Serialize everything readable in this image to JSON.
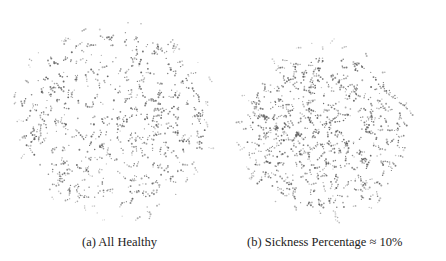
{
  "figure": {
    "subfigures": [
      {
        "label": "(a)",
        "caption": "(a) All Healthy",
        "cloud": {
          "cx": 115,
          "cy": 120,
          "radius": 103,
          "count": 560,
          "seed": 7,
          "core": 0.55
        },
        "caption_x": 82
      },
      {
        "label": "(b)",
        "caption": "(b) Sickness Percentage ≈ 10%",
        "cloud": {
          "cx": 325,
          "cy": 132,
          "radius": 92,
          "count": 600,
          "seed": 21,
          "core": 0.72
        },
        "caption_x": 247
      }
    ],
    "dot_color": "#555555"
  }
}
